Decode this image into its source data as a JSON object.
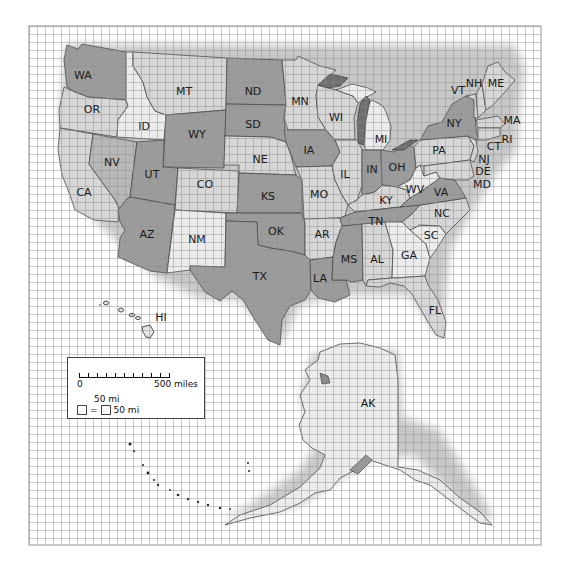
{
  "map": {
    "title": "",
    "grid": {
      "left": 29,
      "top": 26,
      "right": 541,
      "bottom": 545,
      "cell_px": 8,
      "cell_miles": 50,
      "color": "#8c8c8c"
    },
    "colors": {
      "dark": "#9c9c9c",
      "medium": "#b8b8b8",
      "light": "#d6d6d6",
      "lightest": "#ececec",
      "lake": "#6f6f6f",
      "background": "#ffffff"
    },
    "states": [
      {
        "abbr": "WA",
        "x": 83,
        "y": 76,
        "shade": "dark"
      },
      {
        "abbr": "OR",
        "x": 92,
        "y": 110,
        "shade": "light"
      },
      {
        "abbr": "CA",
        "x": 84,
        "y": 193,
        "shade": "light"
      },
      {
        "abbr": "NV",
        "x": 112,
        "y": 163,
        "shade": "medium"
      },
      {
        "abbr": "ID",
        "x": 144,
        "y": 127,
        "shade": "lightest"
      },
      {
        "abbr": "MT",
        "x": 184,
        "y": 92,
        "shade": "light"
      },
      {
        "abbr": "WY",
        "x": 197,
        "y": 135,
        "shade": "dark"
      },
      {
        "abbr": "UT",
        "x": 152,
        "y": 175,
        "shade": "dark"
      },
      {
        "abbr": "CO",
        "x": 205,
        "y": 185,
        "shade": "light"
      },
      {
        "abbr": "AZ",
        "x": 147,
        "y": 235,
        "shade": "dark"
      },
      {
        "abbr": "NM",
        "x": 197,
        "y": 240,
        "shade": "lightest"
      },
      {
        "abbr": "ND",
        "x": 253,
        "y": 92,
        "shade": "dark"
      },
      {
        "abbr": "SD",
        "x": 253,
        "y": 125,
        "shade": "dark"
      },
      {
        "abbr": "NE",
        "x": 260,
        "y": 160,
        "shade": "light"
      },
      {
        "abbr": "KS",
        "x": 268,
        "y": 197,
        "shade": "dark"
      },
      {
        "abbr": "OK",
        "x": 276,
        "y": 232,
        "shade": "dark"
      },
      {
        "abbr": "TX",
        "x": 260,
        "y": 277,
        "shade": "dark"
      },
      {
        "abbr": "MN",
        "x": 300,
        "y": 102,
        "shade": "light"
      },
      {
        "abbr": "IA",
        "x": 309,
        "y": 151,
        "shade": "dark"
      },
      {
        "abbr": "MO",
        "x": 319,
        "y": 195,
        "shade": "light"
      },
      {
        "abbr": "AR",
        "x": 322,
        "y": 235,
        "shade": "light"
      },
      {
        "abbr": "LA",
        "x": 320,
        "y": 279,
        "shade": "dark"
      },
      {
        "abbr": "WI",
        "x": 336,
        "y": 118,
        "shade": "light"
      },
      {
        "abbr": "IL",
        "x": 345,
        "y": 175,
        "shade": "light"
      },
      {
        "abbr": "MI",
        "x": 381,
        "y": 140,
        "shade": "lightest"
      },
      {
        "abbr": "IN",
        "x": 372,
        "y": 170,
        "shade": "dark"
      },
      {
        "abbr": "OH",
        "x": 397,
        "y": 168,
        "shade": "dark"
      },
      {
        "abbr": "KY",
        "x": 386,
        "y": 201,
        "shade": "light"
      },
      {
        "abbr": "TN",
        "x": 376,
        "y": 222,
        "shade": "dark"
      },
      {
        "abbr": "MS",
        "x": 349,
        "y": 260,
        "shade": "dark"
      },
      {
        "abbr": "AL",
        "x": 377,
        "y": 260,
        "shade": "light"
      },
      {
        "abbr": "GA",
        "x": 409,
        "y": 256,
        "shade": "lightest"
      },
      {
        "abbr": "FL",
        "x": 435,
        "y": 311,
        "shade": "light"
      },
      {
        "abbr": "SC",
        "x": 431,
        "y": 236,
        "shade": "lightest"
      },
      {
        "abbr": "NC",
        "x": 442,
        "y": 214,
        "shade": "light"
      },
      {
        "abbr": "VA",
        "x": 441,
        "y": 193,
        "shade": "dark"
      },
      {
        "abbr": "WV",
        "x": 415,
        "y": 190,
        "shade": "lightest"
      },
      {
        "abbr": "PA",
        "x": 439,
        "y": 151,
        "shade": "light"
      },
      {
        "abbr": "NY",
        "x": 454,
        "y": 124,
        "shade": "dark"
      },
      {
        "abbr": "NJ",
        "x": 484,
        "y": 160,
        "shade": "light"
      },
      {
        "abbr": "DE",
        "x": 483,
        "y": 172,
        "shade": "light"
      },
      {
        "abbr": "MD",
        "x": 482,
        "y": 185,
        "shade": "light"
      },
      {
        "abbr": "CT",
        "x": 494,
        "y": 147,
        "shade": "light"
      },
      {
        "abbr": "RI",
        "x": 507,
        "y": 140,
        "shade": "light"
      },
      {
        "abbr": "MA",
        "x": 512,
        "y": 121,
        "shade": "light"
      },
      {
        "abbr": "VT",
        "x": 458,
        "y": 91,
        "shade": "light"
      },
      {
        "abbr": "NH",
        "x": 474,
        "y": 84,
        "shade": "light"
      },
      {
        "abbr": "ME",
        "x": 496,
        "y": 84,
        "shade": "light"
      },
      {
        "abbr": "AK",
        "x": 368,
        "y": 404,
        "shade": "lightest"
      },
      {
        "abbr": "HI",
        "x": 161,
        "y": 318,
        "shade": "lightest"
      }
    ]
  },
  "legend": {
    "scale_start": "0",
    "scale_end": "500 miles",
    "cell_label_top": "50 mi",
    "equals": "=",
    "cell_label_side": "50 mi",
    "ticks": 10
  }
}
